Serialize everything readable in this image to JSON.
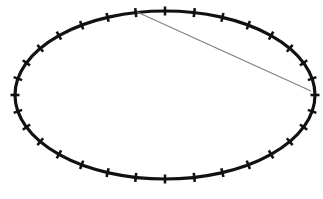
{
  "figure": {
    "name": "ellipse-with-ticks-and-chord",
    "width": 323,
    "height": 199,
    "background_color": "#ffffff"
  },
  "chart_data": {
    "type": "scatter",
    "title": "",
    "subtitle": "",
    "xlabel": "",
    "ylabel": "",
    "grid": false,
    "legend": null,
    "annotations": [],
    "xlim": [
      0,
      323
    ],
    "ylim": [
      0,
      199
    ],
    "ellipse": {
      "center_x": 165,
      "center_y": 95,
      "radius_x": 150,
      "radius_y": 84,
      "rotation_deg": 0,
      "stroke_color": "#111111",
      "stroke_width": 3.2,
      "fill": "none"
    },
    "ticks": {
      "count": 32,
      "length": 9,
      "stroke_color": "#111111",
      "stroke_width": 2.6,
      "orientation": "radial",
      "start_angle_deg": 0,
      "angles_deg": [
        0,
        11.25,
        22.5,
        33.75,
        45,
        56.25,
        67.5,
        78.75,
        90,
        101.25,
        112.5,
        123.75,
        135,
        146.25,
        157.5,
        168.75,
        180,
        191.25,
        202.5,
        213.75,
        225,
        236.25,
        247.5,
        258.75,
        270,
        281.25,
        292.5,
        303.75,
        315,
        326.25,
        337.5,
        348.75
      ]
    },
    "chord": {
      "x1": 137,
      "y1": 12,
      "x2": 311,
      "y2": 91,
      "stroke_color": "#808080",
      "stroke_width": 1.2
    }
  }
}
